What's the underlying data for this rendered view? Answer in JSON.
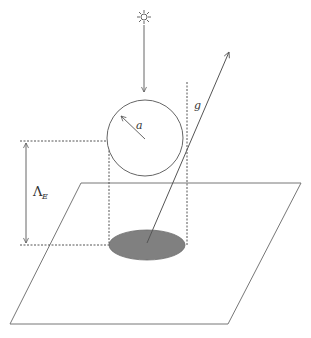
{
  "diagram": {
    "labels": {
      "radius": "a",
      "gravity": "g",
      "height_symbol": "Λ",
      "height_subscript": "E"
    },
    "icons": {
      "sun": "sun-icon"
    },
    "colors": {
      "stroke": "#555555",
      "shadow_fill": "#808080",
      "background": "#ffffff"
    },
    "elements": [
      "sun above sphere with downward arrow (incident sunlight)",
      "sphere of radius a",
      "vertical dashed line through sphere tangent",
      "gravity vector g",
      "height dimension Λ_E between sphere and ground",
      "shadow ellipse on ground plane",
      "ground plane parallelogram"
    ]
  }
}
